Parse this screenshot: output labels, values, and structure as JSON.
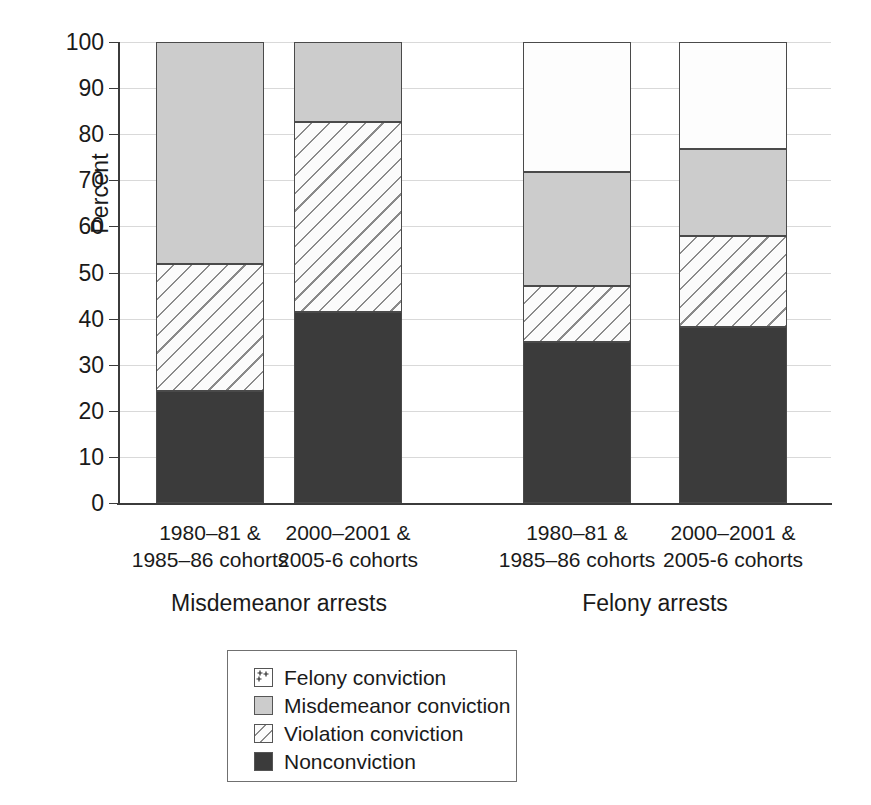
{
  "chart_data": {
    "type": "bar",
    "subtype": "stacked-bar-100",
    "title": "",
    "xlabel": "",
    "ylabel": "Percent",
    "ylim": [
      0,
      100
    ],
    "yticks": [
      0,
      10,
      20,
      30,
      40,
      50,
      60,
      70,
      80,
      90,
      100
    ],
    "ytick_labels": [
      "0",
      "10",
      "20",
      "30",
      "40",
      "50",
      "60",
      "70",
      "80",
      "90",
      "100"
    ],
    "grid": true,
    "legend_position": "below-center",
    "groups": [
      {
        "name": "Misdemeanor arrests"
      },
      {
        "name": "Felony arrests"
      }
    ],
    "categories": [
      "1980–81 &\n1985–86 cohorts",
      "2000–2001 &\n2005-6 cohorts",
      "1980–81 &\n1985–86 cohorts",
      "2000–2001 &\n2005-6 cohorts"
    ],
    "series": [
      {
        "name": "Nonconviction",
        "key": "nonconv",
        "values": [
          24.3,
          41.5,
          34.9,
          38.2
        ]
      },
      {
        "name": "Violation conviction",
        "key": "viol",
        "values": [
          27.5,
          41.1,
          12.2,
          19.7
        ]
      },
      {
        "name": "Misdemeanor conviction",
        "key": "misd",
        "values": [
          48.2,
          17.4,
          24.7,
          18.9
        ]
      },
      {
        "name": "Felony conviction",
        "key": "felony",
        "values": [
          0.0,
          0.0,
          28.2,
          23.2
        ]
      }
    ],
    "bars": [
      {
        "group": "Misdemeanor arrests",
        "category": "1980–81 &\n1985–86 cohorts",
        "segments": [
          {
            "key": "nonconv",
            "label": "Nonconviction",
            "from": 0,
            "to": 24.3
          },
          {
            "key": "viol",
            "label": "Violation conviction",
            "from": 24.3,
            "to": 51.8
          },
          {
            "key": "misd",
            "label": "Misdemeanor conviction",
            "from": 51.8,
            "to": 100
          }
        ]
      },
      {
        "group": "Misdemeanor arrests",
        "category": "2000–2001 &\n2005-6 cohorts",
        "segments": [
          {
            "key": "nonconv",
            "label": "Nonconviction",
            "from": 0,
            "to": 41.5
          },
          {
            "key": "viol",
            "label": "Violation conviction",
            "from": 41.5,
            "to": 82.6
          },
          {
            "key": "misd",
            "label": "Misdemeanor conviction",
            "from": 82.6,
            "to": 100
          }
        ]
      },
      {
        "group": "Felony arrests",
        "category": "1980–81 &\n1985–86 cohorts",
        "segments": [
          {
            "key": "nonconv",
            "label": "Nonconviction",
            "from": 0,
            "to": 34.9
          },
          {
            "key": "viol",
            "label": "Violation conviction",
            "from": 34.9,
            "to": 47.1
          },
          {
            "key": "misd",
            "label": "Misdemeanor conviction",
            "from": 47.1,
            "to": 71.8
          },
          {
            "key": "felony",
            "label": "Felony conviction",
            "from": 71.8,
            "to": 100
          }
        ]
      },
      {
        "group": "Felony arrests",
        "category": "2000–2001 &\n2005-6 cohorts",
        "segments": [
          {
            "key": "nonconv",
            "label": "Nonconviction",
            "from": 0,
            "to": 38.2
          },
          {
            "key": "viol",
            "label": "Violation conviction",
            "from": 38.2,
            "to": 57.9
          },
          {
            "key": "misd",
            "label": "Misdemeanor conviction",
            "from": 57.9,
            "to": 76.8
          },
          {
            "key": "felony",
            "label": "Felony conviction",
            "from": 76.8,
            "to": 100
          }
        ]
      }
    ],
    "legend": [
      {
        "label": "Felony conviction",
        "key": "felony",
        "pattern": "plus-marks",
        "color": "#ffffff"
      },
      {
        "label": "Misdemeanor conviction",
        "key": "misd",
        "pattern": "solid-gray",
        "color": "#cccccc"
      },
      {
        "label": "Violation conviction",
        "key": "viol",
        "pattern": "diagonal-hatch",
        "color": "#fbfbfb"
      },
      {
        "label": "Nonconviction",
        "key": "nonconv",
        "pattern": "solid-dark",
        "color": "#3b3b3b"
      }
    ]
  },
  "colors": {
    "nonconviction": "#3b3b3b",
    "misdemeanor": "#cccccc",
    "violation": "#fbfbfb",
    "felony": "#ffffff",
    "axis": "#3b3b3b",
    "grid": "#d9d9d9",
    "text": "#1a1a1a"
  }
}
